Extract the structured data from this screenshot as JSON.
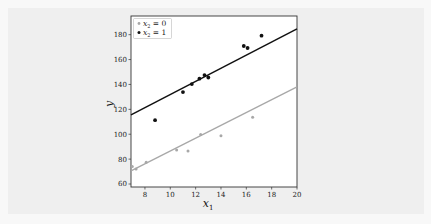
{
  "chart_data": {
    "type": "scatter",
    "title": "",
    "xlabel": "x_1",
    "ylabel": "y",
    "xlim": [
      6.9,
      20
    ],
    "ylim": [
      57.6,
      195
    ],
    "xticks": [
      8,
      10,
      12,
      14,
      16,
      18,
      20
    ],
    "yticks": [
      60,
      80,
      100,
      120,
      140,
      160,
      180
    ],
    "grid": false,
    "legend_position": "upper left",
    "series": [
      {
        "name": "x_2 = 0",
        "color": "#a8a8a8",
        "points": [
          [
            7.0,
            74
          ],
          [
            7.3,
            72
          ],
          [
            8.1,
            77.5
          ],
          [
            10.5,
            87.4
          ],
          [
            11.4,
            86.6
          ],
          [
            12.4,
            99.8
          ],
          [
            14.0,
            98.7
          ],
          [
            16.5,
            113.7
          ]
        ],
        "fit_line": {
          "x": [
            6.9,
            20
          ],
          "y": [
            70.5,
            138
          ]
        }
      },
      {
        "name": "x_2 = 1",
        "color": "#111111",
        "points": [
          [
            8.8,
            111.3
          ],
          [
            11.0,
            133.9
          ],
          [
            11.7,
            140.3
          ],
          [
            12.3,
            144.6
          ],
          [
            12.7,
            147.5
          ],
          [
            13.0,
            145.6
          ],
          [
            15.8,
            170.9
          ],
          [
            16.1,
            169.3
          ],
          [
            17.2,
            179.2
          ]
        ],
        "fit_line": {
          "x": [
            6.9,
            20
          ],
          "y": [
            115.6,
            184.6
          ]
        }
      }
    ]
  },
  "labels": {
    "xlabel_main": "x",
    "xlabel_sub": "1",
    "ylabel": "y",
    "legend": [
      {
        "main": "x",
        "sub": "2",
        "rest": " = 0"
      },
      {
        "main": "x",
        "sub": "2",
        "rest": " = 1"
      }
    ]
  }
}
